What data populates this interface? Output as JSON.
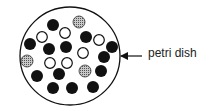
{
  "diagram": {
    "label": "petri dish",
    "dish": {
      "cx": 70,
      "cy": 56,
      "rx": 50,
      "ry": 49
    },
    "colors": {
      "black": "#111111",
      "white": "#ffffff",
      "gray": "#9a9a9a",
      "stroke": "#111111"
    },
    "colonies": [
      {
        "x": 53,
        "y": 25,
        "type": "black"
      },
      {
        "x": 79,
        "y": 22,
        "type": "gray"
      },
      {
        "x": 42,
        "y": 37,
        "type": "white"
      },
      {
        "x": 65,
        "y": 33,
        "type": "white"
      },
      {
        "x": 30,
        "y": 44,
        "type": "black"
      },
      {
        "x": 49,
        "y": 49,
        "type": "black"
      },
      {
        "x": 66,
        "y": 47,
        "type": "black"
      },
      {
        "x": 86,
        "y": 37,
        "type": "black"
      },
      {
        "x": 99,
        "y": 40,
        "type": "white"
      },
      {
        "x": 112,
        "y": 47,
        "type": "black"
      },
      {
        "x": 83,
        "y": 53,
        "type": "white"
      },
      {
        "x": 27,
        "y": 61,
        "type": "gray"
      },
      {
        "x": 50,
        "y": 63,
        "type": "white"
      },
      {
        "x": 67,
        "y": 63,
        "type": "white"
      },
      {
        "x": 104,
        "y": 57,
        "type": "black"
      },
      {
        "x": 37,
        "y": 76,
        "type": "black"
      },
      {
        "x": 59,
        "y": 74,
        "type": "black"
      },
      {
        "x": 85,
        "y": 71,
        "type": "gray"
      },
      {
        "x": 101,
        "y": 71,
        "type": "black"
      },
      {
        "x": 53,
        "y": 88,
        "type": "black"
      },
      {
        "x": 72,
        "y": 88,
        "type": "black"
      },
      {
        "x": 93,
        "y": 87,
        "type": "black"
      }
    ]
  }
}
